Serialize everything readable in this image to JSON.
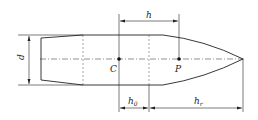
{
  "diagram": {
    "labels": {
      "h": "h",
      "d": "d",
      "C": "C",
      "P": "P",
      "h0": "h",
      "h0_sub": "0",
      "hr": "h",
      "hr_sub": "r"
    },
    "colors": {
      "line": "#222222",
      "background": "#ffffff"
    }
  }
}
